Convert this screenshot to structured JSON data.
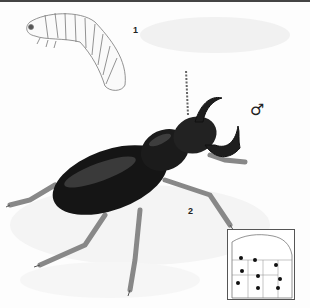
{
  "illustration": {
    "subject": "Stag beetle plate",
    "figures": [
      {
        "number": "1",
        "description": "larva (grub)"
      },
      {
        "number": "2",
        "description": "adult male stag beetle"
      }
    ],
    "sex_symbol": "♂",
    "range_map": {
      "region": "North America",
      "dot_count": 9
    }
  },
  "colors": {
    "beetle_body": "#141414",
    "leg": "#8a8a8a",
    "shadow": "#e6e6e6",
    "line": "#555555"
  }
}
